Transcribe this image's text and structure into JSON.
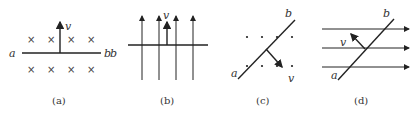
{
  "panels": [
    {
      "id": "a",
      "caption": "(a)",
      "labels": {
        "left": "a",
        "right": "b",
        "velocity": "v"
      },
      "field": "into page (×)"
    },
    {
      "id": "b",
      "caption": "(b)",
      "labels": {
        "left": "b",
        "velocity": "v"
      },
      "field": "upward field lines"
    },
    {
      "id": "c",
      "caption": "(c)",
      "labels": {
        "bottom": "a",
        "top": "b",
        "velocity": "v"
      },
      "field": "out of page (·)"
    },
    {
      "id": "d",
      "caption": "(d)",
      "labels": {
        "bottom": "a",
        "top": "b",
        "velocity": "v"
      },
      "field": "rightward field lines"
    }
  ],
  "symbols": {
    "cross": "×"
  },
  "colors": {
    "line": "#222222",
    "text": "#333333"
  }
}
